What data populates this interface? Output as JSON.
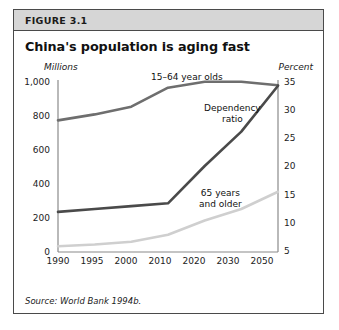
{
  "figure": {
    "label": "FIGURE 3.1",
    "title": "China's population is aging fast",
    "source": "Source: World Bank 1994b."
  },
  "chart_data": {
    "type": "line",
    "title": "China's population is aging fast",
    "xlabel": "",
    "ylabel": "Millions",
    "y2label": "Percent",
    "x": [
      "1990",
      "1995",
      "2000",
      "2010",
      "2020",
      "2030",
      "2050"
    ],
    "categories": [
      "1990",
      "1995",
      "2000",
      "2010",
      "2020",
      "2030",
      "2050"
    ],
    "ylim": [
      0,
      1000
    ],
    "y2lim": [
      5,
      35
    ],
    "yticks": [
      "0",
      "200",
      "400",
      "600",
      "800",
      "1,000"
    ],
    "y2ticks": [
      "5",
      "10",
      "15",
      "20",
      "25",
      "30",
      "35"
    ],
    "grid": false,
    "legend": "inline-annotations",
    "series": [
      {
        "name": "15–64 year olds",
        "axis": "left",
        "unit": "Millions",
        "color": "#6e6e6e",
        "values": [
          765,
          800,
          845,
          955,
          990,
          990,
          970
        ]
      },
      {
        "name": "Dependency ratio",
        "axis": "right",
        "unit": "Percent",
        "color": "#4a4a4a",
        "values": [
          12,
          12.5,
          13,
          13.5,
          20,
          26,
          34
        ]
      },
      {
        "name": "65 years and older",
        "axis": "right",
        "unit": "Percent",
        "color": "#cfcfcf",
        "values": [
          6,
          6.3,
          6.8,
          8,
          10.5,
          12.5,
          15.5
        ]
      }
    ],
    "annotations": [
      {
        "text": "15–64 year olds"
      },
      {
        "text_line1": "Dependency",
        "text_line2": "ratio"
      },
      {
        "text_line1": "65 years",
        "text_line2": "and older"
      }
    ]
  },
  "axes": {
    "left_unit": "Millions",
    "right_unit": "Percent",
    "left_ticks": [
      "1,000",
      "800",
      "600",
      "400",
      "200",
      "0"
    ],
    "right_ticks": [
      "35",
      "30",
      "25",
      "20",
      "15",
      "10",
      "5"
    ],
    "x_ticks": [
      "1990",
      "1995",
      "2000",
      "2010",
      "2020",
      "2030",
      "2050"
    ]
  },
  "labels": {
    "series_1564": "15–64 year olds",
    "series_dep_l1": "Dependency",
    "series_dep_l2": "ratio",
    "series_65_l1": "65 years",
    "series_65_l2": "and older"
  },
  "colors": {
    "line_1564": "#6e6e6e",
    "line_dependency": "#4a4a4a",
    "line_65plus": "#cfcfcf",
    "axis": "#8a8a8a",
    "border": "#4a4a4a",
    "header_bg": "#d6d6d6"
  }
}
